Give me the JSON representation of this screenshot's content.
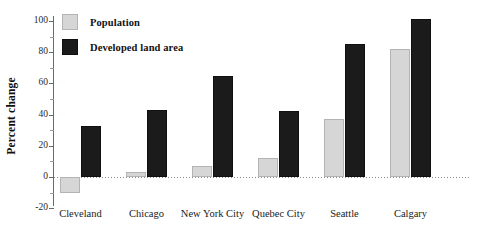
{
  "chart_data": {
    "type": "bar",
    "title": "",
    "subtitle": "",
    "xlabel": "",
    "ylabel": "Percent change",
    "categories": [
      "Cleveland",
      "Chicago",
      "New York City",
      "Quebec City",
      "Seattle",
      "Calgary"
    ],
    "series": [
      {
        "name": "Population",
        "color": "#d6d6d6",
        "values": [
          -10,
          3,
          7,
          12,
          37,
          82
        ]
      },
      {
        "name": "Developed land area",
        "color": "#1b1b1b",
        "values": [
          33,
          43,
          65,
          42,
          85,
          101
        ]
      }
    ],
    "ylim": [
      -20,
      108
    ],
    "yticks": [
      -20,
      0,
      20,
      40,
      60,
      80,
      100
    ],
    "ytick_labels": [
      "-20",
      "0",
      "20",
      "40",
      "60",
      "80",
      "100"
    ],
    "yminor_ticks": [
      -10,
      10,
      30,
      50,
      70,
      90
    ],
    "grid": false,
    "zero_line": true,
    "legend_position": "top-left-inside"
  },
  "axis": {
    "y_title": "Percent change"
  },
  "legend": {
    "entries": [
      {
        "label": "Population"
      },
      {
        "label": "Developed land area"
      }
    ]
  }
}
